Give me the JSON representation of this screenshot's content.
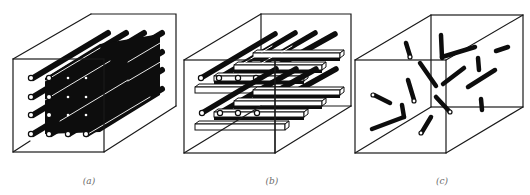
{
  "figure": {
    "panels": [
      {
        "id": "a",
        "label": "(a)",
        "arrangement": "unidirectional continuous fibers (4x4 array)"
      },
      {
        "id": "b",
        "label": "(b)",
        "arrangement": "cross-ply laminate: fiber layers alternating with transverse plies"
      },
      {
        "id": "c",
        "label": "(c)",
        "arrangement": "randomly oriented short fibers"
      }
    ],
    "colors": {
      "line": "#1a1a1a",
      "fiber": "#0d0d0d",
      "background": "#ffffff",
      "label": "#6a6a6a"
    }
  }
}
